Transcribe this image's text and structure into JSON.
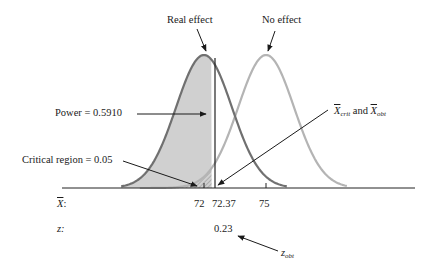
{
  "diagram": {
    "labels": {
      "real_effect": "Real effect",
      "no_effect": "No effect",
      "power": "Power = 0.5910",
      "critical_region": "Critical region = 0.05",
      "xcrit_x": "X",
      "xcrit_sub": "crit",
      "and": " and ",
      "xobt_x": "X",
      "xobt_sub": "obt",
      "xbar_row_label": "X",
      "xbar_row_colon": ":",
      "z_row_label": "z:",
      "zobt_z": "z",
      "zobt_sub": "obt"
    },
    "xbar_ticks": [
      "72",
      "72.37",
      "75"
    ],
    "z_values": [
      "0.23"
    ],
    "colors": {
      "real_effect_curve": "#707070",
      "no_effect_curve": "#b4b4b4",
      "power_fill": "#d0d0d0",
      "hatch": "#9a9a9a",
      "axis": "#222222",
      "text": "#1a1a1a"
    }
  },
  "chart_data": {
    "type": "line",
    "title": "",
    "xlabel": "X̄",
    "series": [
      {
        "name": "Real effect",
        "mean": 72,
        "shape": "normal",
        "shaded_left_of": 72.37,
        "shaded_area": 0.591
      },
      {
        "name": "No effect",
        "mean": 75,
        "shape": "normal",
        "critical_region_left_of": 72.37,
        "critical_area": 0.05
      }
    ],
    "x_ticks": [
      72,
      72.37,
      75
    ],
    "z_ticks": [
      0.23
    ],
    "annotations": [
      "Real effect",
      "No effect",
      "Power = 0.5910",
      "Critical region = 0.05",
      "X̄crit and X̄obt",
      "zobt"
    ]
  }
}
